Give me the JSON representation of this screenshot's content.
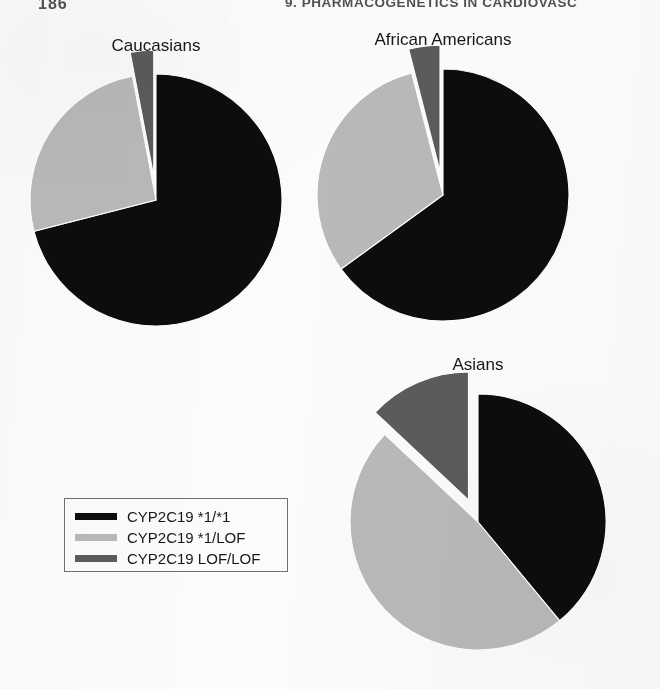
{
  "page": {
    "folio": "186",
    "running_head": "9. PHARMACOGENETICS IN CARDIOVASC",
    "background_color": "#fbfbfa"
  },
  "legend": {
    "name": "chart-legend",
    "entries": [
      {
        "label": "CYP2C19 *1/*1",
        "color": "#0d0d0d",
        "key": "wt_wt"
      },
      {
        "label": "CYP2C19 *1/LOF",
        "color": "#b9b9b9",
        "key": "wt_lof"
      },
      {
        "label": "CYP2C19 LOF/LOF",
        "color": "#5b5b5b",
        "key": "lof_lof"
      }
    ]
  },
  "charts": [
    {
      "id": "caucasians",
      "title": "Caucasians"
    },
    {
      "id": "african-americans",
      "title": "African Americans"
    },
    {
      "id": "asians",
      "title": "Asians"
    }
  ],
  "chart_data": [
    {
      "type": "pie",
      "id": "caucasians",
      "title": "Caucasians",
      "categories": [
        "CYP2C19 *1/*1",
        "CYP2C19 *1/LOF",
        "CYP2C19 LOF/LOF"
      ],
      "values": [
        71,
        26,
        3
      ],
      "unit": "percent",
      "colors": [
        "#0d0d0d",
        "#b9b9b9",
        "#5b5b5b"
      ],
      "exploded": [
        false,
        false,
        true
      ],
      "start_angle_deg": -90,
      "direction": "clockwise",
      "legend_position": "external-lower-left",
      "grid": false
    },
    {
      "type": "pie",
      "id": "african-americans",
      "title": "African Americans",
      "categories": [
        "CYP2C19 *1/*1",
        "CYP2C19 *1/LOF",
        "CYP2C19 LOF/LOF"
      ],
      "values": [
        65,
        31,
        4
      ],
      "unit": "percent",
      "colors": [
        "#0d0d0d",
        "#b9b9b9",
        "#5b5b5b"
      ],
      "exploded": [
        false,
        false,
        true
      ],
      "start_angle_deg": -90,
      "direction": "clockwise",
      "legend_position": "external-lower-left",
      "grid": false
    },
    {
      "type": "pie",
      "id": "asians",
      "title": "Asians",
      "categories": [
        "CYP2C19 *1/*1",
        "CYP2C19 *1/LOF",
        "CYP2C19 LOF/LOF"
      ],
      "values": [
        39,
        48,
        13
      ],
      "unit": "percent",
      "colors": [
        "#0d0d0d",
        "#b9b9b9",
        "#5b5b5b"
      ],
      "exploded": [
        false,
        false,
        true
      ],
      "start_angle_deg": -90,
      "direction": "clockwise",
      "legend_position": "external-lower-left",
      "grid": false
    }
  ],
  "layout": {
    "pies": [
      {
        "id": "caucasians",
        "cx": 156,
        "cy": 200,
        "r": 126,
        "title_x": 156,
        "title_y": 36
      },
      {
        "id": "african-americans",
        "cx": 443,
        "cy": 195,
        "r": 126,
        "title_x": 443,
        "title_y": 30
      },
      {
        "id": "asians",
        "cx": 478,
        "cy": 522,
        "r": 128,
        "title_x": 478,
        "title_y": 355
      }
    ]
  }
}
